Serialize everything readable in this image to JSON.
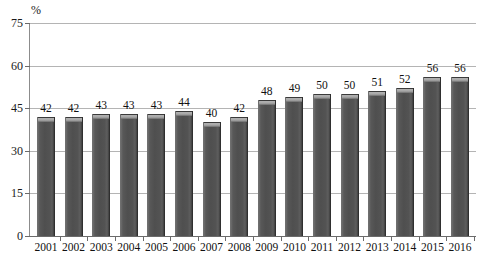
{
  "chart_data": {
    "type": "bar",
    "title": "",
    "subtitle": "",
    "xlabel": "",
    "ylabel": "%",
    "unit_label": "%",
    "ylim": [
      0,
      75
    ],
    "ytick_step": 15,
    "ytick_labels": [
      "0",
      "15",
      "30",
      "45",
      "60",
      "75"
    ],
    "ytick_values": [
      0,
      15,
      30,
      45,
      60,
      75
    ],
    "grid": true,
    "grid_orientation": "horizontal",
    "legend": null,
    "legend_position": "none",
    "bar_color": "#545454",
    "bar_highlight_color": "#b5b5b5",
    "gridline_color": "#b4b4b4",
    "axis_color": "#6b6b6b",
    "text_color": "#111111",
    "categories": [
      "2001",
      "2002",
      "2003",
      "2004",
      "2005",
      "2006",
      "2007",
      "2008",
      "2009",
      "2010",
      "2011",
      "2012",
      "2013",
      "2014",
      "2015",
      "2016"
    ],
    "values": [
      42,
      42,
      43,
      43,
      43,
      44,
      40,
      42,
      48,
      49,
      50,
      50,
      51,
      52,
      56,
      56
    ],
    "data_labels": [
      "42",
      "42",
      "43",
      "43",
      "43",
      "44",
      "40",
      "42",
      "48",
      "49",
      "50",
      "50",
      "51",
      "52",
      "56",
      "56"
    ],
    "series": [
      {
        "name": "",
        "values": [
          42,
          42,
          43,
          43,
          43,
          44,
          40,
          42,
          48,
          49,
          50,
          50,
          51,
          52,
          56,
          56
        ]
      }
    ]
  }
}
